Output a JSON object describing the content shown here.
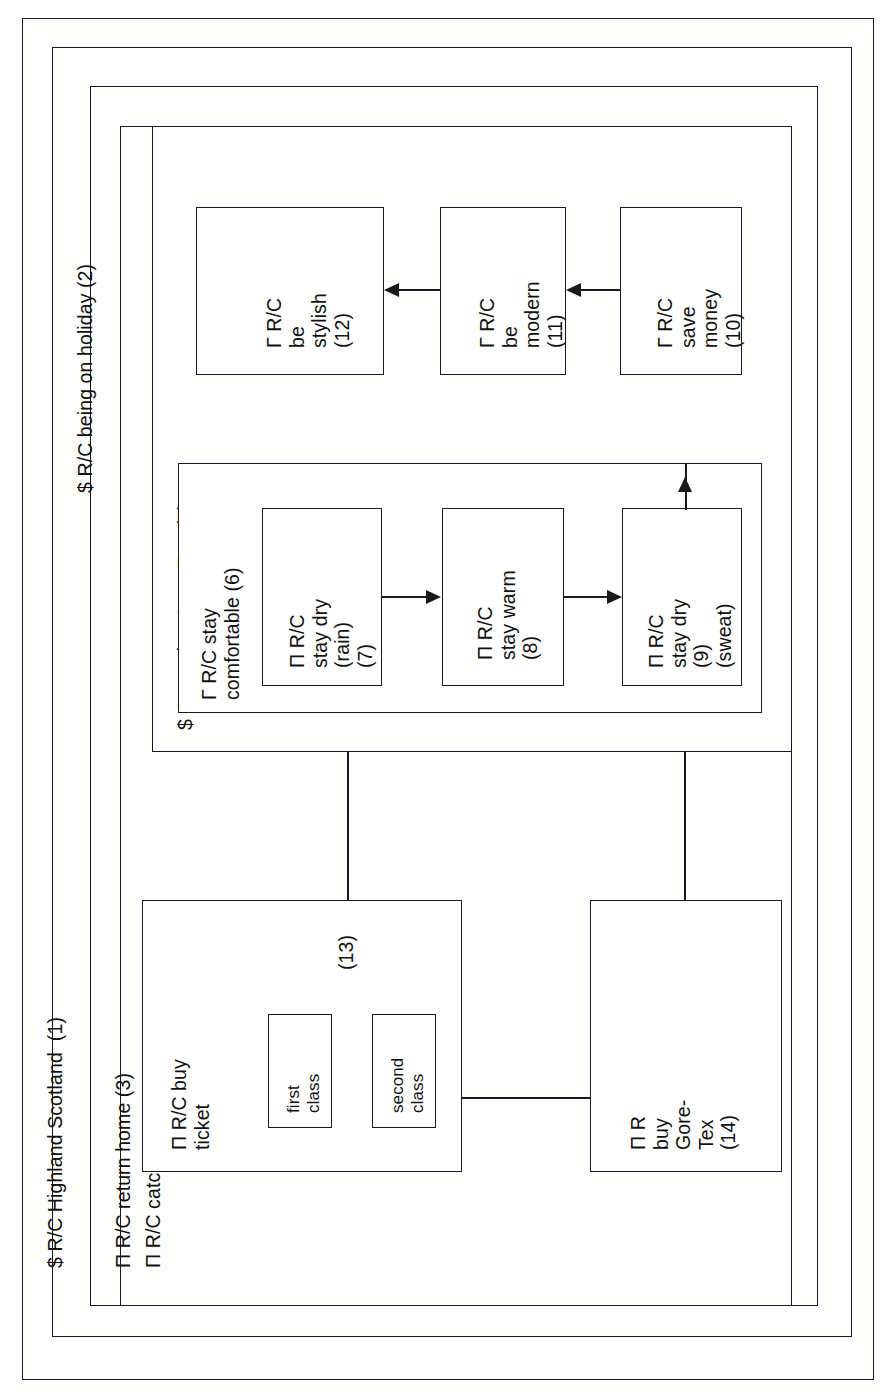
{
  "diagram": {
    "orientation": "rotated-90-ccw",
    "frames": [
      {
        "id": "f1",
        "label": "$ R/C Highland Scotland  (1)"
      },
      {
        "id": "f2",
        "label": "$ R/C being on holiday (2)"
      },
      {
        "id": "f3",
        "label": "Π R/C return home (3)"
      },
      {
        "id": "f4",
        "label": "Π R/C catch train (failure) (4)"
      },
      {
        "id": "f5",
        "label": "$ C wearing Gore-Tex  (5)"
      }
    ],
    "boxes": [
      {
        "id": "b6",
        "label": "Γ R/C stay\ncomfortable (6)"
      },
      {
        "id": "b7",
        "label": "Π R/C\nstay dry\n(rain)\n(7)"
      },
      {
        "id": "b8",
        "label": "Π R/C\nstay warm\n(8)"
      },
      {
        "id": "b9",
        "label": "Π R/C\nstay dry\n(9)\n(sweat)"
      },
      {
        "id": "b10",
        "label": "Γ R/C\nsave\nmoney\n(10)"
      },
      {
        "id": "b11",
        "label": "Γ R/C\nbe\nmodern\n(11)"
      },
      {
        "id": "b12",
        "label": "Γ R/C\nbe\nstylish\n(12)"
      },
      {
        "id": "b13",
        "label": "Π R/C buy\nticket"
      },
      {
        "id": "b13tag",
        "label": "(13)"
      },
      {
        "id": "b14",
        "label": "Π R\nbuy\nGore-\nTex\n(14)"
      }
    ],
    "subboxes": [
      {
        "id": "s_first",
        "label": "first\nclass"
      },
      {
        "id": "s_second",
        "label": "second\nclass"
      }
    ],
    "colors": {
      "stroke": "#1a1a1a",
      "text": "#111111",
      "background": "#ffffff"
    }
  }
}
